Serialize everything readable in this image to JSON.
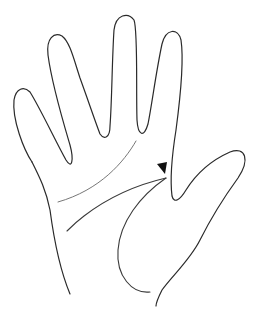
{
  "figure": {
    "background": "#ffffff",
    "stroke_color": "#2a2a2a",
    "marker": {
      "type": "arrowhead",
      "color": "#111111",
      "points_to": "start of life line between index finger and thumb"
    },
    "elements": [
      "hand-outline",
      "heart-line",
      "head-line",
      "life-line",
      "arrowhead-marker"
    ]
  }
}
